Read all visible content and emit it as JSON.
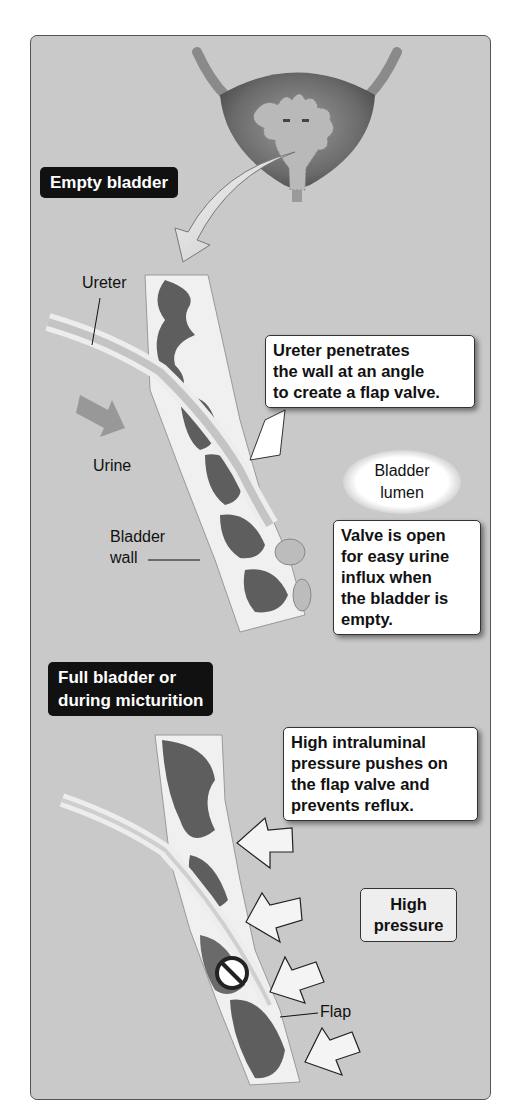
{
  "figure": {
    "section_empty": {
      "tag": "Empty bladder",
      "labels": {
        "ureter": "Ureter",
        "urine": "Urine",
        "bladder_wall": "Bladder\nwall",
        "bladder_lumen": "Bladder\nlumen"
      },
      "callouts": {
        "angle": "Ureter penetrates\nthe wall at an angle\nto create a flap valve.",
        "valve_open": "Valve is open\nfor easy urine\ninflux when\nthe bladder is\nempty."
      }
    },
    "section_full": {
      "tag": "Full bladder or\nduring micturition",
      "callouts": {
        "pressure": "High intraluminal\npressure pushes on\nthe flap valve and\nprevents reflux."
      },
      "labels": {
        "high_pressure": "High\npressure",
        "flap": "Flap"
      },
      "icons": [
        "prohibition-icon",
        "pressure-arrow-icon",
        "pressure-arrow-icon",
        "pressure-arrow-icon",
        "pressure-arrow-icon"
      ]
    }
  },
  "colors": {
    "background": "#c9c9c9",
    "tag_bg": "#111111",
    "muscle": "#5a5a5a",
    "wall": "#f2f2f2"
  }
}
